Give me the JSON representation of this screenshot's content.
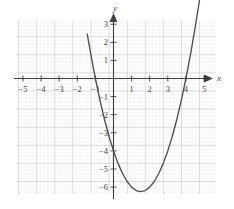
{
  "figure": {
    "kind": "cartesian-graph",
    "background_color": "#ffffff",
    "grid_minor_color": "#d9dee3",
    "grid_major_color": "#9aa3ac",
    "axis_color": "#3f3f3f",
    "curve_color": "#4d4d4d",
    "label_color": "#4a4a4a"
  },
  "axes": {
    "x_axis_label": "x",
    "y_axis_label": "y",
    "x_ticks": [
      {
        "value": -5,
        "label": "−5"
      },
      {
        "value": -4,
        "label": "−4"
      },
      {
        "value": -3,
        "label": "−3"
      },
      {
        "value": -2,
        "label": "−2"
      },
      {
        "value": -1,
        "label": "−1"
      },
      {
        "value": 1,
        "label": "1"
      },
      {
        "value": 2,
        "label": "2"
      },
      {
        "value": 3,
        "label": "3"
      },
      {
        "value": 4,
        "label": "4"
      },
      {
        "value": 5,
        "label": "5"
      }
    ],
    "y_ticks": [
      {
        "value": 3,
        "label": "3"
      },
      {
        "value": 2,
        "label": "2"
      },
      {
        "value": 1,
        "label": "1"
      },
      {
        "value": -1,
        "label": "−1"
      },
      {
        "value": -2,
        "label": "−2"
      },
      {
        "value": -3,
        "label": "−3"
      },
      {
        "value": -4,
        "label": "−4"
      },
      {
        "value": -5,
        "label": "−5"
      },
      {
        "value": -6,
        "label": "−6"
      }
    ]
  },
  "chart_data": {
    "type": "line",
    "title": "",
    "subtitle": "",
    "xlabel": "x",
    "ylabel": "y",
    "grid": true,
    "minor_grid": true,
    "minor_divisions_per_unit": 5,
    "legend": null,
    "xlim": [
      -6.2,
      6.2
    ],
    "ylim": [
      -7.1,
      3.6
    ],
    "xticks": [
      -5,
      -4,
      -3,
      -2,
      -1,
      1,
      2,
      3,
      4,
      5
    ],
    "yticks": [
      3,
      2,
      1,
      -1,
      -2,
      -3,
      -4,
      -5,
      -6
    ],
    "series": [
      {
        "name": "parabola",
        "kind": "quadratic",
        "equation": "y = x^2 - 3x - 4",
        "color": "#4d4d4d",
        "vertex": [
          1.5,
          -6.25
        ],
        "x_intercepts": [
          -1,
          4
        ],
        "y_intercept": -4,
        "x_domain": [
          -1.45,
          4.93
        ],
        "x": [
          -1.45,
          -1.2,
          -1.0,
          -0.75,
          -0.5,
          -0.25,
          0,
          0.25,
          0.5,
          0.75,
          1.0,
          1.25,
          1.5,
          1.75,
          2.0,
          2.25,
          2.5,
          2.75,
          3.0,
          3.25,
          3.5,
          3.75,
          4.0,
          4.25,
          4.5,
          4.75,
          4.93
        ],
        "y": [
          2.45,
          1.04,
          0,
          -1.19,
          -2.25,
          -3.19,
          -4,
          -4.69,
          -5.25,
          -5.69,
          -6.0,
          -6.19,
          -6.25,
          -6.19,
          -6.0,
          -5.69,
          -5.25,
          -4.69,
          -4,
          -3.19,
          -2.25,
          -1.19,
          0,
          1.31,
          2.75,
          4.31,
          5.51
        ]
      }
    ]
  }
}
